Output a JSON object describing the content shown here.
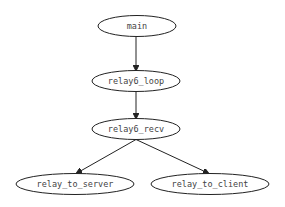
{
  "diagram": {
    "type": "call-graph",
    "nodes": [
      {
        "id": "main",
        "label": "main",
        "cx": 137,
        "cy": 26,
        "rx": 39,
        "ry": 10.5
      },
      {
        "id": "relay6_loop",
        "label": "relay6_loop",
        "cx": 136,
        "cy": 81,
        "rx": 44,
        "ry": 10.5
      },
      {
        "id": "relay6_recv",
        "label": "relay6_recv",
        "cx": 136,
        "cy": 129,
        "rx": 44,
        "ry": 10.5
      },
      {
        "id": "relay_to_server",
        "label": "relay_to_server",
        "cx": 75,
        "cy": 184,
        "rx": 59,
        "ry": 10.5
      },
      {
        "id": "relay_to_client",
        "label": "relay_to_client",
        "cx": 210,
        "cy": 184,
        "rx": 59,
        "ry": 10.5
      }
    ],
    "edges": [
      {
        "from": "main",
        "to": "relay6_loop"
      },
      {
        "from": "relay6_loop",
        "to": "relay6_recv"
      },
      {
        "from": "relay6_recv",
        "to": "relay_to_server"
      },
      {
        "from": "relay6_recv",
        "to": "relay_to_client"
      }
    ]
  }
}
